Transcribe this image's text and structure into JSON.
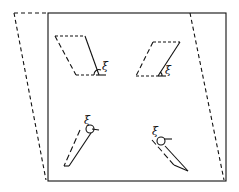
{
  "diagram": {
    "labels": {
      "top_left": "ξ",
      "top_right": "ξ",
      "bottom_left": "ξ",
      "bottom_right": "ξ"
    },
    "colors": {
      "stroke": "#111111",
      "background": "#ffffff"
    }
  }
}
